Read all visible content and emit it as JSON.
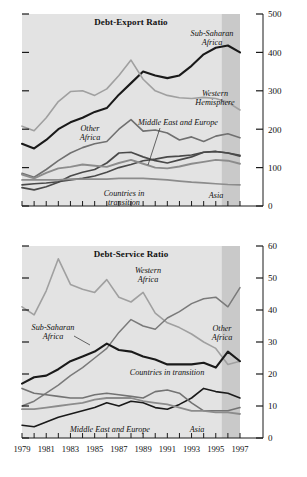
{
  "figure": {
    "background_color": "#ffffff",
    "plot_background_color": "#e3e3e3",
    "forecast_shade_color": "#c9c9c9",
    "axis_color": "#1a1a1a"
  },
  "panels": [
    {
      "id": "debt-export-ratio",
      "title": "Debt-Export Ratio",
      "y_ticks": [
        "0",
        "100",
        "200",
        "300",
        "400",
        "500"
      ],
      "x_ticks": [
        "1979",
        "1981",
        "1983",
        "1985",
        "1987",
        "1989",
        "1991",
        "1993",
        "1995",
        "1997"
      ],
      "series_labels": [
        {
          "text_line1": "Sub-Saharan",
          "text_line2": "Africa"
        },
        {
          "text_line1": "Western",
          "text_line2": "Hemisphere"
        },
        {
          "text_line1": "Other",
          "text_line2": "Africa"
        },
        {
          "text_line1": "Middle East and Europe",
          "text_line2": ""
        },
        {
          "text_line1": "Countries in",
          "text_line2": "transition"
        },
        {
          "text_line1": "Asia",
          "text_line2": ""
        }
      ]
    },
    {
      "id": "debt-service-ratio",
      "title": "Debt-Service Ratio",
      "y_ticks": [
        "0",
        "10",
        "20",
        "30",
        "40",
        "50",
        "60"
      ],
      "x_ticks": [
        "1979",
        "1981",
        "1983",
        "1985",
        "1987",
        "1989",
        "1991",
        "1993",
        "1995",
        "1997"
      ],
      "series_labels": [
        {
          "text_line1": "Western",
          "text_line2": "Hemisphere"
        },
        {
          "text_line1": "Sub-Saharan",
          "text_line2": "Africa"
        },
        {
          "text_line1": "Other",
          "text_line2": "Africa"
        },
        {
          "text_line1": "Countries in transition",
          "text_line2": ""
        },
        {
          "text_line1": "Middle East and Europe",
          "text_line2": ""
        },
        {
          "text_line1": "Asia",
          "text_line2": ""
        }
      ]
    }
  ],
  "chart_data": [
    {
      "type": "line",
      "title": "Debt-Export Ratio",
      "xlabel": "",
      "ylabel": "",
      "ylim": [
        0,
        500
      ],
      "xlim": [
        1979,
        1997
      ],
      "grid": false,
      "legend": "inline-annotations",
      "y_ticks": [
        0,
        100,
        200,
        300,
        400,
        500
      ],
      "y_minor_ticks": [
        50,
        150,
        250,
        350,
        450
      ],
      "x_ticks": [
        1979,
        1981,
        1983,
        1985,
        1987,
        1989,
        1991,
        1993,
        1995,
        1997
      ],
      "x_minor_ticks": [
        1980,
        1982,
        1984,
        1986,
        1988,
        1990,
        1992,
        1994,
        1996
      ],
      "forecast_region": [
        1995.5,
        1997
      ],
      "x": [
        1979,
        1980,
        1981,
        1982,
        1983,
        1984,
        1985,
        1986,
        1987,
        1988,
        1989,
        1990,
        1991,
        1992,
        1993,
        1994,
        1995,
        1996,
        1997
      ],
      "series": [
        {
          "name": "Sub-Saharan Africa",
          "color": "#1a1a1a",
          "width": 2.1,
          "values": [
            162,
            150,
            172,
            200,
            218,
            230,
            245,
            255,
            290,
            320,
            350,
            340,
            333,
            340,
            365,
            395,
            412,
            418,
            400,
            368
          ]
        },
        {
          "name": "Western Hemisphere",
          "color": "#a0a0a0",
          "width": 1.6,
          "values": [
            208,
            196,
            230,
            272,
            298,
            300,
            288,
            305,
            340,
            380,
            330,
            300,
            288,
            282,
            280,
            283,
            280,
            270,
            250,
            222
          ]
        },
        {
          "name": "Other Africa",
          "color": "#707070",
          "width": 1.6,
          "values": [
            85,
            75,
            95,
            118,
            138,
            152,
            162,
            168,
            200,
            225,
            195,
            198,
            190,
            172,
            180,
            168,
            182,
            188,
            178,
            165
          ]
        },
        {
          "name": "Middle East and Europe",
          "color": "#4a4a4a",
          "width": 1.6,
          "values": [
            55,
            58,
            60,
            63,
            68,
            72,
            78,
            88,
            100,
            108,
            118,
            122,
            128,
            130,
            133,
            140,
            142,
            138,
            132,
            118
          ]
        },
        {
          "name": "Countries in transition",
          "color": "#4a4a4a",
          "width": 1.7,
          "values": [
            48,
            42,
            50,
            62,
            78,
            88,
            95,
            112,
            138,
            140,
            128,
            118,
            112,
            120,
            128,
            140,
            142,
            138,
            130,
            110
          ]
        },
        {
          "name": "Asia",
          "color": "#8c8c8c",
          "width": 1.9,
          "values": [
            82,
            72,
            86,
            98,
            102,
            108,
            105,
            102,
            112,
            120,
            110,
            100,
            98,
            103,
            110,
            115,
            120,
            118,
            110,
            100
          ]
        },
        {
          "name": "Asia-flat",
          "color": "#8c8c8c",
          "width": 1.7,
          "values": [
            68,
            68,
            68,
            68,
            70,
            70,
            70,
            70,
            72,
            72,
            72,
            70,
            68,
            65,
            62,
            60,
            58,
            56,
            55,
            54
          ]
        }
      ]
    },
    {
      "type": "line",
      "title": "Debt-Service Ratio",
      "xlabel": "",
      "ylabel": "",
      "ylim": [
        0,
        60
      ],
      "xlim": [
        1979,
        1997
      ],
      "grid": false,
      "legend": "inline-annotations",
      "y_ticks": [
        0,
        10,
        20,
        30,
        40,
        50,
        60
      ],
      "y_minor_ticks": [
        5,
        15,
        25,
        35,
        45,
        55
      ],
      "x_ticks": [
        1979,
        1981,
        1983,
        1985,
        1987,
        1989,
        1991,
        1993,
        1995,
        1997
      ],
      "x_minor_ticks": [
        1980,
        1982,
        1984,
        1986,
        1988,
        1990,
        1992,
        1994,
        1996
      ],
      "forecast_region": [
        1995.5,
        1997
      ],
      "x": [
        1979,
        1980,
        1981,
        1982,
        1983,
        1984,
        1985,
        1986,
        1987,
        1988,
        1989,
        1990,
        1991,
        1992,
        1993,
        1994,
        1995,
        1996,
        1997
      ],
      "series": [
        {
          "name": "Western Hemisphere",
          "color": "#a0a0a0",
          "width": 1.6,
          "values": [
            41,
            38.5,
            46,
            56,
            48,
            46.5,
            45.5,
            49.5,
            44,
            42.5,
            45.5,
            39,
            36,
            34.5,
            32.5,
            30,
            28,
            23,
            24,
            23
          ]
        },
        {
          "name": "Sub-Saharan Africa",
          "color": "#7a7a7a",
          "width": 1.5,
          "values": [
            10,
            11.5,
            14,
            16.5,
            19.5,
            22,
            25,
            28,
            33,
            37,
            35,
            34,
            37.5,
            39.5,
            42,
            43.5,
            44,
            41,
            47,
            35,
            32.5
          ]
        },
        {
          "name": "Other Africa",
          "color": "#1a1a1a",
          "width": 2.1,
          "values": [
            17,
            19,
            19.5,
            21.5,
            24,
            25.5,
            27,
            29.5,
            27.5,
            27,
            25.5,
            24.5,
            23,
            23,
            23,
            23.5,
            22,
            27,
            24,
            23
          ]
        },
        {
          "name": "Countries in transition",
          "color": "#1a1a1a",
          "width": 1.6,
          "values": [
            4,
            3.5,
            5,
            6.5,
            7.5,
            8.5,
            9.5,
            11,
            10,
            11.5,
            11,
            9.5,
            9,
            10.5,
            12.5,
            15.5,
            14.5,
            14,
            12.5,
            10.5
          ]
        },
        {
          "name": "Middle East and Europe",
          "color": "#737373",
          "width": 1.6,
          "values": [
            15.5,
            14,
            13.5,
            13,
            12.5,
            12.5,
            13.5,
            14,
            13.5,
            13,
            12.5,
            14.5,
            15,
            14,
            11,
            8.5,
            8.5,
            8.5,
            9.5,
            9.5
          ]
        },
        {
          "name": "Asia",
          "color": "#8c8c8c",
          "width": 1.8,
          "values": [
            9,
            9,
            9.5,
            10,
            10.5,
            11,
            12,
            12.5,
            12.5,
            12.5,
            11.5,
            11,
            10.5,
            9.5,
            8.5,
            8.5,
            8,
            8,
            7.5,
            7
          ]
        }
      ]
    }
  ]
}
